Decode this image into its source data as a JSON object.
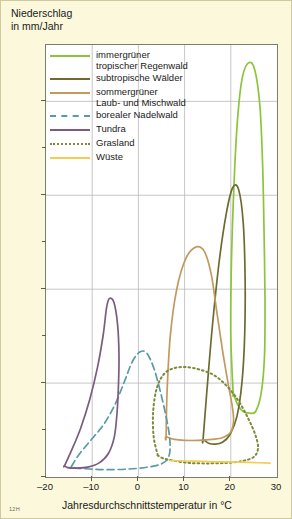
{
  "chart_data": {
    "type": "line",
    "title": "Niederschlag in mm/Jahr",
    "ylabel": "Niederschlag\nin mm/Jahr",
    "xlabel": "Jahresdurchschnittstemperatur in °C",
    "xlim": [
      -20,
      30
    ],
    "ylim": [
      0,
      4600
    ],
    "xticks": [
      -20,
      -10,
      0,
      10,
      20,
      30
    ],
    "xtick_labels": [
      "–20",
      "–10",
      "0",
      "10",
      "20",
      "30"
    ],
    "yticks": [
      0,
      1000,
      2000,
      3000,
      4000
    ],
    "ytick_labels": [
      "0",
      "1000",
      "2000",
      "3000",
      "4000"
    ],
    "yminor_ticks": [
      500,
      1500,
      2500,
      3500
    ],
    "grid": true,
    "legend_position": "top-left-inside",
    "watermark": "12H",
    "series": [
      {
        "name": "immergrüner tropischer Regenwald",
        "label": "immergrüner\ntropischer Regenwald",
        "color": "#8cc43c",
        "style": "solid",
        "shape": "closed-loop",
        "points": [
          [
            20.5,
            900
          ],
          [
            20.0,
            1500
          ],
          [
            20.1,
            2200
          ],
          [
            20.6,
            3000
          ],
          [
            21.3,
            3700
          ],
          [
            22.3,
            4200
          ],
          [
            23.6,
            4400
          ],
          [
            25.1,
            4350
          ],
          [
            26.3,
            3950
          ],
          [
            26.9,
            3300
          ],
          [
            27.2,
            2600
          ],
          [
            27.4,
            1900
          ],
          [
            27.3,
            1300
          ],
          [
            26.6,
            900
          ],
          [
            25.4,
            700
          ],
          [
            24.0,
            680
          ],
          [
            22.6,
            700
          ],
          [
            21.4,
            780
          ],
          [
            20.5,
            900
          ]
        ]
      },
      {
        "name": "subtropische Wälder",
        "label": "subtropische Wälder",
        "color": "#6d6b2f",
        "style": "solid",
        "shape": "closed-loop",
        "points": [
          [
            14.0,
            400
          ],
          [
            14.8,
            900
          ],
          [
            16.0,
            1600
          ],
          [
            17.5,
            2300
          ],
          [
            19.0,
            2800
          ],
          [
            20.4,
            3080
          ],
          [
            21.7,
            3060
          ],
          [
            22.7,
            2700
          ],
          [
            23.1,
            2100
          ],
          [
            23.0,
            1500
          ],
          [
            22.4,
            1000
          ],
          [
            21.3,
            640
          ],
          [
            19.8,
            450
          ],
          [
            18.2,
            370
          ],
          [
            16.6,
            350
          ],
          [
            15.2,
            360
          ],
          [
            14.0,
            400
          ]
        ]
      },
      {
        "name": "sommergrüner Laub- und Mischwald",
        "label": "sommergrüner\nLaub- und Mischwald",
        "color": "#c29a5e",
        "style": "solid",
        "shape": "closed-loop",
        "points": [
          [
            6.0,
            430
          ],
          [
            6.2,
            900
          ],
          [
            6.9,
            1500
          ],
          [
            8.3,
            2000
          ],
          [
            10.3,
            2330
          ],
          [
            12.5,
            2450
          ],
          [
            14.3,
            2400
          ],
          [
            15.8,
            2150
          ],
          [
            17.0,
            1750
          ],
          [
            18.2,
            1350
          ],
          [
            19.4,
            1000
          ],
          [
            20.3,
            760
          ],
          [
            20.6,
            600
          ],
          [
            20.0,
            480
          ],
          [
            18.3,
            420
          ],
          [
            16.0,
            400
          ],
          [
            13.0,
            390
          ],
          [
            10.0,
            390
          ],
          [
            7.8,
            400
          ],
          [
            6.0,
            430
          ]
        ]
      },
      {
        "name": "borealer Nadelwald",
        "label": "borealer Nadelwald",
        "color": "#5a9aa5",
        "style": "dashed",
        "shape": "closed-loop",
        "points": [
          [
            -14.5,
            110
          ],
          [
            -13.0,
            230
          ],
          [
            -10.5,
            380
          ],
          [
            -7.5,
            560
          ],
          [
            -5.0,
            780
          ],
          [
            -3.0,
            1020
          ],
          [
            -1.3,
            1230
          ],
          [
            0.3,
            1330
          ],
          [
            1.8,
            1320
          ],
          [
            3.4,
            1150
          ],
          [
            4.8,
            900
          ],
          [
            6.0,
            640
          ],
          [
            6.8,
            400
          ],
          [
            6.6,
            220
          ],
          [
            5.0,
            140
          ],
          [
            2.0,
            105
          ],
          [
            -2.0,
            85
          ],
          [
            -6.5,
            78
          ],
          [
            -10.5,
            85
          ],
          [
            -13.5,
            95
          ],
          [
            -14.5,
            110
          ]
        ]
      },
      {
        "name": "Tundra",
        "label": "Tundra",
        "color": "#7c5b82",
        "style": "solid",
        "shape": "closed-loop",
        "points": [
          [
            -16.0,
            120
          ],
          [
            -14.5,
            280
          ],
          [
            -12.5,
            520
          ],
          [
            -10.5,
            830
          ],
          [
            -8.8,
            1180
          ],
          [
            -7.6,
            1520
          ],
          [
            -6.9,
            1800
          ],
          [
            -6.3,
            1900
          ],
          [
            -5.3,
            1860
          ],
          [
            -4.5,
            1620
          ],
          [
            -4.2,
            1300
          ],
          [
            -4.3,
            1000
          ],
          [
            -4.6,
            700
          ],
          [
            -5.2,
            430
          ],
          [
            -6.5,
            250
          ],
          [
            -8.5,
            150
          ],
          [
            -11.0,
            105
          ],
          [
            -13.5,
            95
          ],
          [
            -15.3,
            100
          ],
          [
            -16.0,
            120
          ]
        ]
      },
      {
        "name": "Grasland",
        "label": "Grasland",
        "color": "#7d8a3a",
        "style": "dotted",
        "shape": "closed-loop",
        "points": [
          [
            4.2,
            230
          ],
          [
            3.3,
            430
          ],
          [
            3.2,
            700
          ],
          [
            4.0,
            950
          ],
          [
            5.6,
            1100
          ],
          [
            7.8,
            1160
          ],
          [
            10.5,
            1170
          ],
          [
            13.5,
            1140
          ],
          [
            16.5,
            1080
          ],
          [
            19.3,
            960
          ],
          [
            21.8,
            800
          ],
          [
            23.8,
            620
          ],
          [
            25.3,
            450
          ],
          [
            25.9,
            310
          ],
          [
            25.0,
            215
          ],
          [
            22.5,
            170
          ],
          [
            19.0,
            150
          ],
          [
            15.0,
            145
          ],
          [
            11.0,
            150
          ],
          [
            7.5,
            175
          ],
          [
            5.3,
            200
          ],
          [
            4.2,
            230
          ]
        ]
      },
      {
        "name": "Wüste",
        "label": "Wüste",
        "color": "#f2ce55",
        "style": "solid",
        "shape": "open-line",
        "points": [
          [
            7.0,
            175
          ],
          [
            12.0,
            168
          ],
          [
            17.0,
            162
          ],
          [
            22.0,
            158
          ],
          [
            26.0,
            152
          ],
          [
            28.5,
            148
          ]
        ]
      }
    ]
  },
  "legend": {
    "items": [
      {
        "label": "immergrüner\ntropischer Regenwald",
        "color": "#8cc43c",
        "style": "solid"
      },
      {
        "label": "subtropische Wälder",
        "color": "#6d6b2f",
        "style": "solid"
      },
      {
        "label": "sommergrüner\nLaub- und Mischwald",
        "color": "#c29a5e",
        "style": "solid"
      },
      {
        "label": "borealer Nadelwald",
        "color": "#5a9aa5",
        "style": "dashed"
      },
      {
        "label": "Tundra",
        "color": "#7c5b82",
        "style": "solid"
      },
      {
        "label": "Grasland",
        "color": "#7d8a3a",
        "style": "dotted"
      },
      {
        "label": "Wüste",
        "color": "#f2ce55",
        "style": "solid"
      }
    ]
  },
  "axes": {
    "y_title": "Niederschlag\nin mm/Jahr",
    "x_title": "Jahresdurchschnittstemperatur in °C"
  },
  "footer": {
    "source_code": "12H"
  }
}
